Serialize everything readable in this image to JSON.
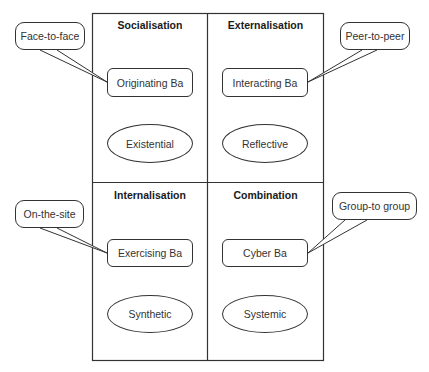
{
  "quadrants": [
    {
      "heading": "Socialisation",
      "ba": "Originating Ba",
      "type": "Existential",
      "callout": "Face-to-face"
    },
    {
      "heading": "Externalisation",
      "ba": "Interacting Ba",
      "type": "Reflective",
      "callout": "Peer-to-peer"
    },
    {
      "heading": "Internalisation",
      "ba": "Exercising Ba",
      "type": "Synthetic",
      "callout": "On-the-site"
    },
    {
      "heading": "Combination",
      "ba": "Cyber Ba",
      "type": "Systemic",
      "callout": "Group-to group"
    }
  ]
}
